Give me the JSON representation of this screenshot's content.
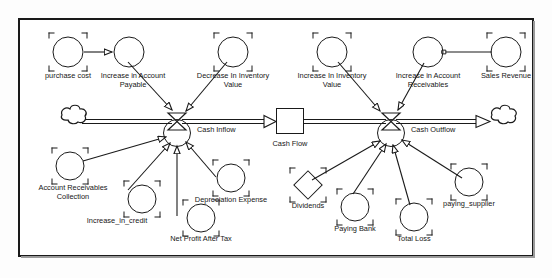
{
  "diagram": {
    "type": "stock-and-flow",
    "stroke_color": "#1a1a1a",
    "background_color": "#ffffff",
    "stock": {
      "name": "cash-flow-stock",
      "label": "Cash Flow",
      "shape": "rectangle"
    },
    "flows": [
      {
        "name": "cash-inflow",
        "label": "Cash Inflow",
        "shape": "valve"
      },
      {
        "name": "cash-outflow",
        "label": "Cash Outflow",
        "shape": "valve"
      }
    ],
    "sources_sinks": [
      {
        "name": "source-cloud",
        "label": "",
        "shape": "cloud"
      },
      {
        "name": "sink-cloud",
        "label": "",
        "shape": "cloud"
      }
    ],
    "variables": [
      {
        "name": "purchase-cost",
        "label": "purchase cost",
        "shape": "circle",
        "selected": true
      },
      {
        "name": "increase-in-account-payable",
        "label": "Increase in Account\nPayable",
        "shape": "circle",
        "selected": false
      },
      {
        "name": "decrease-in-inventory-value",
        "label": "Decrease In Inventory\nValue",
        "shape": "circle",
        "selected": true
      },
      {
        "name": "increase-in-inventory-value",
        "label": "Increase In Inventory\nValue",
        "shape": "circle",
        "selected": true
      },
      {
        "name": "increase-in-account-receivables",
        "label": "Increase in Account\nReceivables",
        "shape": "circle",
        "selected": false
      },
      {
        "name": "sales-revenue",
        "label": "Sales Revenue",
        "shape": "circle",
        "selected": true
      },
      {
        "name": "account-receivables-collection",
        "label": "Account Receivables\nCollection",
        "shape": "circle",
        "selected": true
      },
      {
        "name": "increase-in-credit",
        "label": "Increase_in_credit",
        "shape": "circle",
        "selected": true
      },
      {
        "name": "net-profit-after-tax",
        "label": "Net Profit After Tax",
        "shape": "circle",
        "selected": true
      },
      {
        "name": "depreciation-expense",
        "label": "Depreciation Expense",
        "shape": "circle",
        "selected": true
      },
      {
        "name": "dividends",
        "label": "Dividends",
        "shape": "diamond",
        "selected": true
      },
      {
        "name": "paying-bank",
        "label": "Paying Bank",
        "shape": "circle",
        "selected": true
      },
      {
        "name": "total-loss",
        "label": "Total Loss",
        "shape": "circle",
        "selected": true
      },
      {
        "name": "paying-supplier",
        "label": "paying_supplier",
        "shape": "circle",
        "selected": true
      }
    ],
    "connectors": [
      {
        "from": "purchase cost",
        "to": "Increase in Account Payable"
      },
      {
        "from": "Increase in Account Payable",
        "to": "Cash Inflow"
      },
      {
        "from": "Decrease In Inventory Value",
        "to": "Cash Inflow"
      },
      {
        "from": "Account Receivables Collection",
        "to": "Cash Inflow"
      },
      {
        "from": "Increase_in_credit",
        "to": "Cash Inflow"
      },
      {
        "from": "Net Profit After Tax",
        "to": "Cash Inflow"
      },
      {
        "from": "Depreciation Expense",
        "to": "Cash Inflow"
      },
      {
        "from": "Sales Revenue",
        "to": "Increase in Account Receivables"
      },
      {
        "from": "Increase In Inventory Value",
        "to": "Cash Outflow"
      },
      {
        "from": "Increase in Account Receivables",
        "to": "Cash Outflow"
      },
      {
        "from": "Dividends",
        "to": "Cash Outflow"
      },
      {
        "from": "Paying Bank",
        "to": "Cash Outflow"
      },
      {
        "from": "Total Loss",
        "to": "Cash Outflow"
      },
      {
        "from": "paying_supplier",
        "to": "Cash Outflow"
      }
    ],
    "flow_pipes": [
      {
        "from": "source-cloud",
        "to": "Cash Inflow"
      },
      {
        "from": "Cash Inflow",
        "to": "Cash Flow"
      },
      {
        "from": "Cash Flow",
        "to": "Cash Outflow"
      },
      {
        "from": "Cash Outflow",
        "to": "sink-cloud"
      }
    ]
  }
}
